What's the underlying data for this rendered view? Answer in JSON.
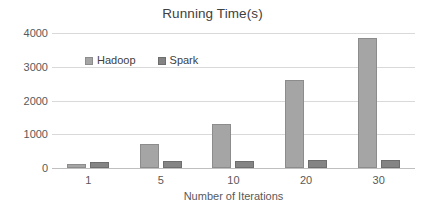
{
  "chart_data": {
    "type": "bar",
    "title": "Running Time(s)",
    "xlabel": "Number of Iterations",
    "ylabel": "",
    "categories": [
      "1",
      "5",
      "10",
      "20",
      "30"
    ],
    "series": [
      {
        "name": "Hadoop",
        "color": "#a5a5a5",
        "values": [
          130,
          700,
          1300,
          2600,
          3850
        ]
      },
      {
        "name": "Spark",
        "color": "#848484",
        "values": [
          180,
          200,
          210,
          230,
          240
        ]
      }
    ],
    "ylim": [
      0,
      4000
    ],
    "yticks": [
      "0",
      "1000",
      "2000",
      "3000",
      "4000"
    ],
    "ytick_values": [
      0,
      1000,
      2000,
      3000,
      4000
    ],
    "grid": true,
    "legend_position": "top-left-inside"
  }
}
